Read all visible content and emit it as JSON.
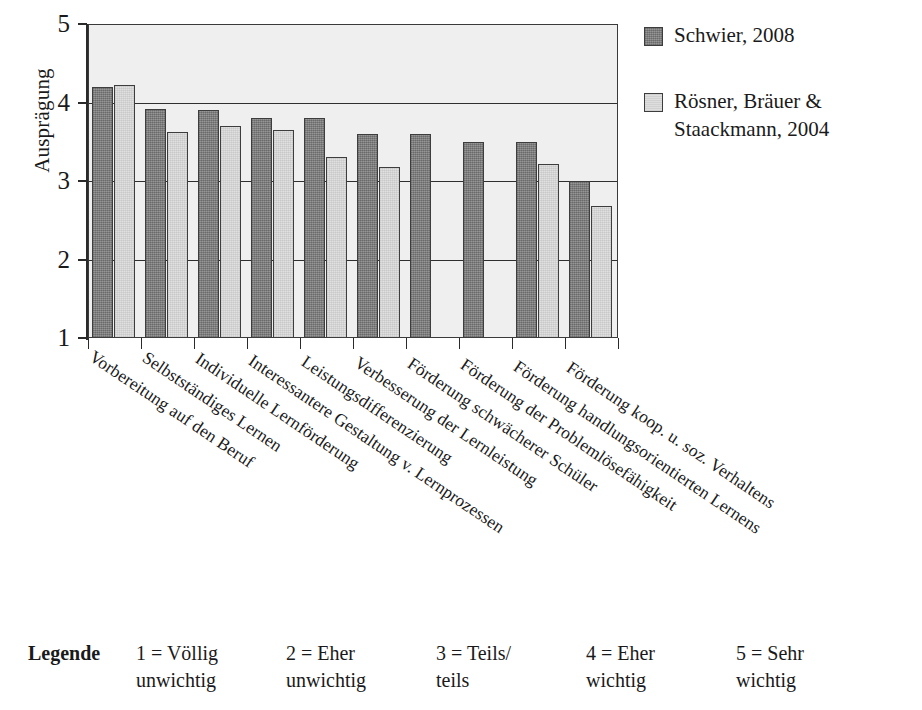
{
  "chart_data": {
    "type": "bar",
    "title": "",
    "xlabel": "",
    "ylabel": "Ausprägung",
    "ylim": [
      1,
      5
    ],
    "ytick_labels": [
      "5",
      "4",
      "3",
      "2",
      "1"
    ],
    "ytick_values": [
      5,
      4,
      3,
      2,
      1
    ],
    "gridlines": [
      5,
      4,
      3,
      2
    ],
    "grid": true,
    "legend_position": "right",
    "categories": [
      "Vorbereitung auf den Beruf",
      "Selbstständiges Lernen",
      "Individuelle Lernförderung",
      "Interessantere Gestaltung v. Lernprozessen",
      "Leistungsdifferenzierung",
      "Verbesserung der Lernleistung",
      "Förderung schwächerer Schüler",
      "Förderung der Problemlösefähigkeit",
      "Förderung handlungsorientierten Lernens",
      "Förderung koop. u. soz. Verhaltens"
    ],
    "series": [
      {
        "name": "Schwier, 2008",
        "color": "#8a8a8a",
        "values": [
          4.2,
          3.92,
          3.9,
          3.8,
          3.8,
          3.6,
          3.6,
          3.5,
          3.5,
          3.0
        ]
      },
      {
        "name": "Rösner, Bräuer & Staackmann, 2004",
        "color": "#dcdcdc",
        "values": [
          4.22,
          3.63,
          3.7,
          3.65,
          3.3,
          3.18,
          null,
          null,
          3.22,
          2.68
        ]
      }
    ]
  },
  "series_legend": [
    {
      "label": "Schwier, 2008",
      "swatch": "dark"
    },
    {
      "label": "Rösner, Bräuer & Staackmann, 2004",
      "swatch": "light"
    }
  ],
  "scale_legend": {
    "title": "Legende",
    "items": [
      {
        "line1": "1 = Völlig",
        "line2": "unwichtig"
      },
      {
        "line1": "2 = Eher",
        "line2": "unwichtig"
      },
      {
        "line1": "3 = Teils/",
        "line2": "teils"
      },
      {
        "line1": "4 = Eher",
        "line2": "wichtig"
      },
      {
        "line1": "5 = Sehr",
        "line2": "wichtig"
      }
    ]
  }
}
